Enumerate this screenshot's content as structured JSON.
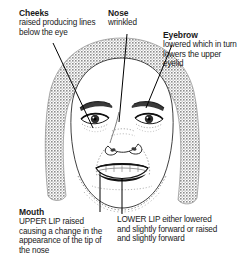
{
  "diagram": {
    "image_alt": "Line drawing of a woman's face showing the expression of disgust, with labelled callouts",
    "colors": {
      "ink": "#1a1a1a",
      "hair": "#a8a8a8",
      "skin": "#ffffff",
      "leader_line": "#000000"
    }
  },
  "callouts": {
    "cheeks": {
      "title": "Cheeks",
      "body": "raised producing lines below the eye"
    },
    "nose": {
      "title": "Nose",
      "body": "wrinkled"
    },
    "eyebrow": {
      "title": "Eyebrow",
      "body": "lowered which in turn lowers the upper eyelid"
    },
    "mouth": {
      "title": "Mouth",
      "body": "UPPER LIP raised causing a change in the appearance of the tip of the nose"
    },
    "lower_lip": {
      "title": "",
      "body": "LOWER LIP either lowered and slightly forward or raised and slightly forward"
    }
  }
}
